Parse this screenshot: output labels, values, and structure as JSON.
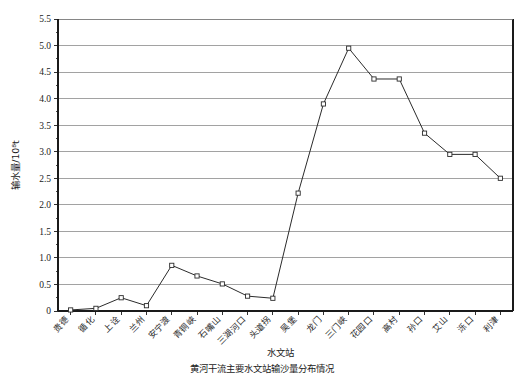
{
  "chart_data": {
    "type": "line",
    "title": "",
    "xlabel": "水文站",
    "ylabel": "输水量/10⁸t",
    "ylim": [
      0,
      5.5
    ],
    "ytick_step": 0.5,
    "grid": true,
    "legend": "none",
    "marker": "open-square",
    "line_color": "#2b2b2b",
    "categories": [
      "贵德",
      "循化",
      "上诠",
      "兰州",
      "安宁渡",
      "青铜峡",
      "石嘴山",
      "三湖河口",
      "头道拐",
      "吴堡",
      "龙门",
      "三门峡",
      "花园口",
      "高村",
      "孙口",
      "艾山",
      "泺口",
      "利津"
    ],
    "values": [
      0.02,
      0.05,
      0.25,
      0.1,
      0.86,
      0.66,
      0.51,
      0.28,
      0.24,
      2.22,
      3.9,
      4.95,
      4.37,
      4.37,
      3.35,
      2.95,
      2.95,
      2.5
    ],
    "ytick_labels": [
      "0",
      "0.5",
      "1.0",
      "1.5",
      "2.0",
      "2.5",
      "3.0",
      "3.5",
      "4.0",
      "4.5",
      "5.0",
      "5.5"
    ],
    "ytick_values": [
      0,
      0.5,
      1.0,
      1.5,
      2.0,
      2.5,
      3.0,
      3.5,
      4.0,
      4.5,
      5.0,
      5.5
    ]
  },
  "caption": {
    "partial_line": "黄河干流主要水文站输沙量分布情况"
  }
}
